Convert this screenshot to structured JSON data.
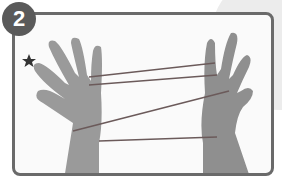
{
  "step": {
    "number": "2",
    "badge_color": "#5a5a5a",
    "frame_color": "#6a6a6a"
  },
  "illustration": {
    "description": "Two hands holding a string figure (cat's cradle) with strings looped between fingers",
    "marker": "star-icon",
    "string_color": "#6b5a5a"
  }
}
